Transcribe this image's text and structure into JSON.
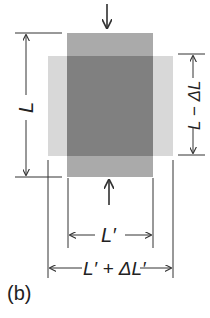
{
  "panel_label": "(b)",
  "labels": {
    "original_length": "L",
    "compressed_length": "L − ΔL",
    "original_width": "L′",
    "expanded_width": "L′ + ΔL′"
  },
  "forces": {
    "top": "compressive force arrow (down)",
    "bottom": "compressive force arrow (up)"
  },
  "colors": {
    "original_shape": "#a8a8a8",
    "deformed_shape": "#d6d6d6",
    "overlap": "#7e7e7e",
    "lines": "#333333"
  }
}
